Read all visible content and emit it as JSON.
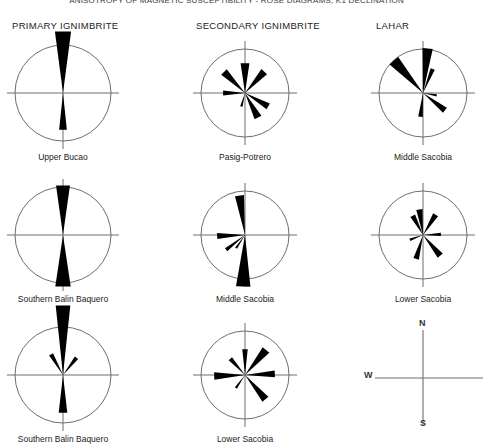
{
  "figure": {
    "title": "ANISOTROPY OF MAGNETIC SUSCEPTIBILITY - ROSE DIAGRAMS, K1 DECLINATION",
    "stroke_color": "#6e6e6e",
    "petal_color": "#000000"
  },
  "columns": [
    {
      "label": "PRIMARY IGNIMBRITE"
    },
    {
      "label": "SECONDARY IGNIMBRITE"
    },
    {
      "label": "LAHAR"
    }
  ],
  "compass": {
    "north_label": "N",
    "south_label": "S",
    "west_label": "W"
  },
  "diagrams": [
    {
      "site": "Upper Bucao",
      "column": "PRIMARY IGNIMBRITE",
      "row": 1,
      "radius": 48,
      "petals": [
        {
          "azimuth": 0,
          "length": 62,
          "width_deg": 15
        },
        {
          "azimuth": 180,
          "length": 37,
          "width_deg": 12
        }
      ]
    },
    {
      "site": "Pasig-Potrero",
      "column": "SECONDARY IGNIMBRITE",
      "row": 1,
      "radius": 44,
      "petals": [
        {
          "azimuth": 0,
          "length": 30,
          "width_deg": 17
        },
        {
          "azimuth": 42,
          "length": 29,
          "width_deg": 15
        },
        {
          "azimuth": 315,
          "length": 30,
          "width_deg": 15
        },
        {
          "azimuth": 270,
          "length": 22,
          "width_deg": 13
        },
        {
          "azimuth": 152,
          "length": 28,
          "width_deg": 16
        },
        {
          "azimuth": 120,
          "length": 27,
          "width_deg": 14
        },
        {
          "azimuth": 195,
          "length": 14,
          "width_deg": 10
        }
      ]
    },
    {
      "site": "Middle Sacobia",
      "column": "LAHAR",
      "row": 1,
      "radius": 44,
      "petals": [
        {
          "azimuth": 6,
          "length": 45,
          "width_deg": 13
        },
        {
          "azimuth": 318,
          "length": 44,
          "width_deg": 15
        },
        {
          "azimuth": 22,
          "length": 26,
          "width_deg": 10
        },
        {
          "azimuth": 128,
          "length": 28,
          "width_deg": 13
        },
        {
          "azimuth": 186,
          "length": 24,
          "width_deg": 11
        },
        {
          "azimuth": 100,
          "length": 14,
          "width_deg": 9
        }
      ]
    },
    {
      "site": "Southern Balin Baquero",
      "column": "PRIMARY IGNIMBRITE",
      "row": 2,
      "radius": 48,
      "petals": [
        {
          "azimuth": 0,
          "length": 50,
          "width_deg": 16
        },
        {
          "azimuth": 180,
          "length": 52,
          "width_deg": 17
        }
      ]
    },
    {
      "site": "Middle Sacobia",
      "column": "SECONDARY IGNIMBRITE",
      "row": 2,
      "radius": 44,
      "petals": [
        {
          "azimuth": 352,
          "length": 40,
          "width_deg": 13
        },
        {
          "azimuth": 182,
          "length": 52,
          "width_deg": 16
        },
        {
          "azimuth": 268,
          "length": 28,
          "width_deg": 12
        },
        {
          "azimuth": 232,
          "length": 24,
          "width_deg": 9
        },
        {
          "azimuth": 214,
          "length": 16,
          "width_deg": 8
        }
      ]
    },
    {
      "site": "Lower Sacobia",
      "column": "LAHAR",
      "row": 2,
      "radius": 44,
      "petals": [
        {
          "azimuth": 352,
          "length": 26,
          "width_deg": 14
        },
        {
          "azimuth": 332,
          "length": 22,
          "width_deg": 14
        },
        {
          "azimuth": 32,
          "length": 24,
          "width_deg": 14
        },
        {
          "azimuth": 88,
          "length": 18,
          "width_deg": 11
        },
        {
          "azimuth": 140,
          "length": 27,
          "width_deg": 14
        },
        {
          "azimuth": 196,
          "length": 25,
          "width_deg": 13
        },
        {
          "azimuth": 250,
          "length": 14,
          "width_deg": 10
        }
      ]
    },
    {
      "site": "Southern Balin Baquero",
      "column": "PRIMARY IGNIMBRITE",
      "row": 3,
      "radius": 48,
      "petals": [
        {
          "azimuth": 0,
          "length": 70,
          "width_deg": 12
        },
        {
          "azimuth": 180,
          "length": 38,
          "width_deg": 13
        },
        {
          "azimuth": 330,
          "length": 24,
          "width_deg": 11
        },
        {
          "azimuth": 38,
          "length": 22,
          "width_deg": 11
        }
      ]
    },
    {
      "site": "Lower Sacobia",
      "column": "SECONDARY IGNIMBRITE",
      "row": 3,
      "radius": 44,
      "petals": [
        {
          "azimuth": 0,
          "length": 26,
          "width_deg": 12
        },
        {
          "azimuth": 40,
          "length": 33,
          "width_deg": 15
        },
        {
          "azimuth": 88,
          "length": 30,
          "width_deg": 13
        },
        {
          "azimuth": 140,
          "length": 32,
          "width_deg": 14
        },
        {
          "azimuth": 268,
          "length": 31,
          "width_deg": 14
        },
        {
          "azimuth": 318,
          "length": 22,
          "width_deg": 12
        },
        {
          "azimuth": 215,
          "length": 16,
          "width_deg": 9
        }
      ]
    }
  ]
}
